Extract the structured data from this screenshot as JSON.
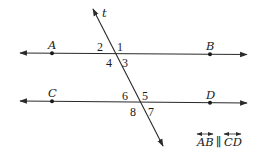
{
  "diagram": {
    "transversal": {
      "label": "t"
    },
    "lines": [
      {
        "id": "AB",
        "points": [
          {
            "label": "A"
          },
          {
            "label": "B"
          }
        ]
      },
      {
        "id": "CD",
        "points": [
          {
            "label": "C"
          },
          {
            "label": "D"
          }
        ]
      }
    ],
    "angles": {
      "upper": [
        "2",
        "1",
        "4",
        "3"
      ],
      "lower": [
        "6",
        "5",
        "8",
        "7"
      ]
    },
    "given": {
      "left": "AB",
      "symbol": "∥",
      "right": "CD"
    },
    "colors": {
      "ink": "#2a2a2a",
      "background": "#ffffff"
    }
  }
}
